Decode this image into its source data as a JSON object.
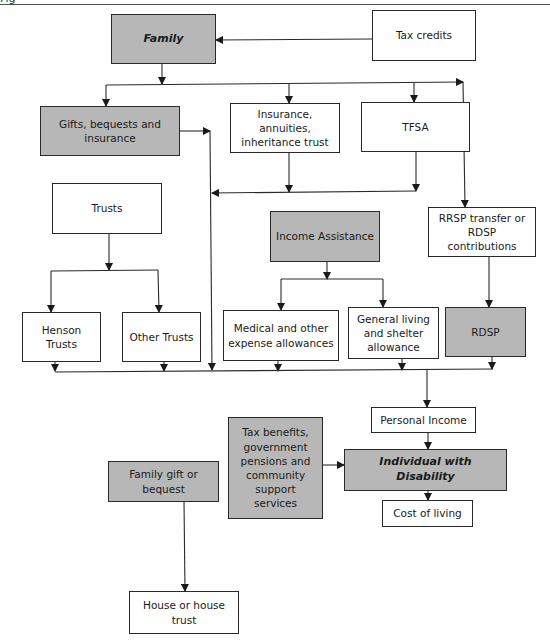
{
  "header": {
    "text": "Fig"
  },
  "colors": {
    "shaded_box": "#b7b7b7",
    "plain_box": "#ffffff",
    "line": "#2a2a2a"
  },
  "nodes": {
    "family": {
      "label": "Family",
      "shaded": true,
      "emphasis": true
    },
    "tax_credits": {
      "label": "Tax credits",
      "shaded": false
    },
    "gifts": {
      "label": "Gifts, bequests and insurance",
      "shaded": true
    },
    "insurance": {
      "label": "Insurance, annuities, inheritance trust",
      "shaded": false
    },
    "tfsa": {
      "label": "TFSA",
      "shaded": false
    },
    "trusts": {
      "label": "Trusts",
      "shaded": false
    },
    "income_assistance": {
      "label": "Income Assistance",
      "shaded": true
    },
    "rrsp": {
      "label": "RRSP transfer or RDSP contributions",
      "shaded": false
    },
    "henson": {
      "label": "Henson Trusts",
      "shaded": false
    },
    "other_trusts": {
      "label": "Other Trusts",
      "shaded": false
    },
    "medical": {
      "label": "Medical and other expense allowances",
      "shaded": false
    },
    "general_living": {
      "label": "General living and shelter allowance",
      "shaded": false
    },
    "rdsp": {
      "label": "RDSP",
      "shaded": true
    },
    "personal_income": {
      "label": "Personal Income",
      "shaded": false
    },
    "tax_benefits": {
      "label": "Tax benefits, government pensions and community support services",
      "shaded": true
    },
    "individual": {
      "label": "Individual with Disability",
      "shaded": true,
      "emphasis": true
    },
    "family_gift": {
      "label": "Family gift or bequest",
      "shaded": true
    },
    "cost_of_living": {
      "label": "Cost of living",
      "shaded": false
    },
    "house": {
      "label": "House or house trust",
      "shaded": false
    }
  },
  "edges": [
    [
      "tax_credits",
      "family"
    ],
    [
      "family",
      "gifts"
    ],
    [
      "family",
      "insurance"
    ],
    [
      "family",
      "tfsa"
    ],
    [
      "family",
      "rrsp"
    ],
    [
      "gifts",
      "personal_income"
    ],
    [
      "insurance",
      "personal_income"
    ],
    [
      "tfsa",
      "personal_income"
    ],
    [
      "trusts",
      "henson"
    ],
    [
      "trusts",
      "other_trusts"
    ],
    [
      "income_assistance",
      "medical"
    ],
    [
      "income_assistance",
      "general_living"
    ],
    [
      "rrsp",
      "rdsp"
    ],
    [
      "henson",
      "personal_income"
    ],
    [
      "other_trusts",
      "personal_income"
    ],
    [
      "medical",
      "personal_income"
    ],
    [
      "general_living",
      "personal_income"
    ],
    [
      "rdsp",
      "personal_income"
    ],
    [
      "personal_income",
      "individual"
    ],
    [
      "tax_benefits",
      "individual"
    ],
    [
      "individual",
      "cost_of_living"
    ],
    [
      "family_gift",
      "house"
    ]
  ]
}
